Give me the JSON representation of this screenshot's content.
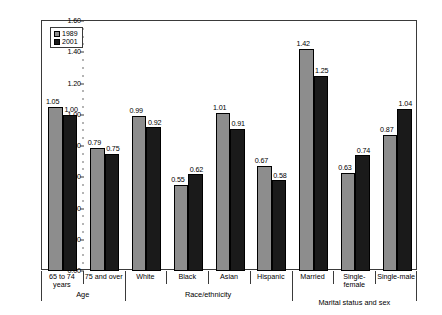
{
  "chart_data": {
    "type": "bar",
    "title": "",
    "xlabel": "",
    "ylabel": "Ratio of mean values",
    "ylim": [
      0.0,
      1.6
    ],
    "ytick_labels": [
      "0.00",
      "0.20",
      "0.40",
      "0.60",
      "0.80",
      "1.00",
      "1.20",
      "1.40",
      "1.60"
    ],
    "ytick_values": [
      0.0,
      0.2,
      0.4,
      0.6,
      0.8,
      1.0,
      1.2,
      1.4,
      1.6
    ],
    "grid": false,
    "legend_position": "top-left",
    "categories": [
      "65 to 74\nyears",
      "75 and over",
      "White",
      "Black",
      "Asian",
      "Hispanic",
      "Married",
      "Single-\nfemale",
      "Single-male"
    ],
    "series": [
      {
        "name": "1989",
        "color": "#8d8d8d",
        "values": [
          1.05,
          0.79,
          0.99,
          0.55,
          1.01,
          0.67,
          1.42,
          0.63,
          0.87
        ],
        "labels": [
          "1.05",
          "0.79",
          "0.99",
          "0.55",
          "1.01",
          "0.67",
          "1.42",
          "0.63",
          "0.87"
        ]
      },
      {
        "name": "2001",
        "color": "#1a1a1a",
        "values": [
          1.0,
          0.75,
          0.92,
          0.62,
          0.91,
          0.58,
          1.25,
          0.74,
          1.04
        ],
        "labels": [
          "1.00",
          "0.75",
          "0.92",
          "0.62",
          "0.91",
          "0.58",
          "1.25",
          "0.74",
          "1.04"
        ]
      }
    ],
    "groups": [
      {
        "label": "Age",
        "categories": [
          "65 to 74\nyears",
          "75 and over"
        ]
      },
      {
        "label": "Race/ethnicity",
        "categories": [
          "White",
          "Black",
          "Asian",
          "Hispanic"
        ]
      },
      {
        "label": "Marital status and sex",
        "categories": [
          "Married",
          "Single-\nfemale",
          "Single-male"
        ]
      }
    ]
  },
  "legend": {
    "items": [
      {
        "label": "1989",
        "color": "#8d8d8d"
      },
      {
        "label": "2001",
        "color": "#1a1a1a"
      }
    ]
  }
}
